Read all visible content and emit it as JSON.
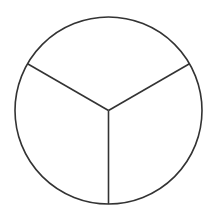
{
  "diagram": {
    "type": "circle-divided-into-equal-parts",
    "parts": 3,
    "center": [
      108.5,
      110.5
    ],
    "radius": 93.5,
    "spoke_angles_deg": [
      90,
      210,
      330
    ],
    "stroke_color": "#333333",
    "fill_color": "#ffffff",
    "stroke_width": 1.6
  }
}
